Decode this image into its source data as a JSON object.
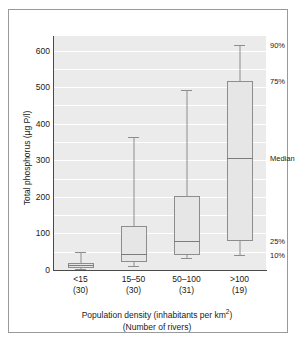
{
  "chart_data": {
    "type": "box",
    "title": "",
    "xlabel": "Population density (inhabitants per km2)",
    "xlabel_line2": "(Number of rivers)",
    "ylabel": "Total phosphorus (µg P/l)",
    "ylim": [
      0,
      640
    ],
    "yticks": [
      0,
      100,
      200,
      300,
      400,
      500,
      600
    ],
    "ytick_labels": [
      "0",
      "100",
      "200",
      "300",
      "400",
      "500",
      "600"
    ],
    "grid": true,
    "grid_minor_step": 50,
    "legend_position": "right-inline-annotations",
    "categories": [
      "<15",
      "15–50",
      "50–100",
      ">100"
    ],
    "counts": [
      "(30)",
      "(30)",
      "(31)",
      "(19)"
    ],
    "percentiles": [
      "10%",
      "25%",
      "Median",
      "75%",
      "90%"
    ],
    "boxes": [
      {
        "category": "<15",
        "n": 30,
        "p10": 4,
        "p25": 6,
        "median": 14,
        "p75": 18,
        "p90": 50
      },
      {
        "category": "15–50",
        "n": 30,
        "p10": 10,
        "p25": 22,
        "median": 45,
        "p75": 120,
        "p90": 365
      },
      {
        "category": "50–100",
        "n": 31,
        "p10": 32,
        "p25": 40,
        "median": 80,
        "p75": 202,
        "p90": 492
      },
      {
        "category": ">100",
        "n": 19,
        "p10": 42,
        "p25": 78,
        "median": 305,
        "p75": 518,
        "p90": 615
      }
    ],
    "annotations": [
      {
        "label": "90%",
        "value": 615
      },
      {
        "label": "75%",
        "value": 518
      },
      {
        "label": "Median",
        "value": 305
      },
      {
        "label": "25%",
        "value": 78
      },
      {
        "label": "10%",
        "value": 42
      }
    ],
    "colors": {
      "plot_background": "#ebebeb",
      "gridline": "#ffffff",
      "box_fill": "#e6e6e6",
      "box_edge": "#8d8d8d",
      "median_line": "#7c7c7c",
      "axis": "#4a4a4a",
      "text": "#1a1a1a",
      "frame": "#9a9a9a"
    }
  }
}
